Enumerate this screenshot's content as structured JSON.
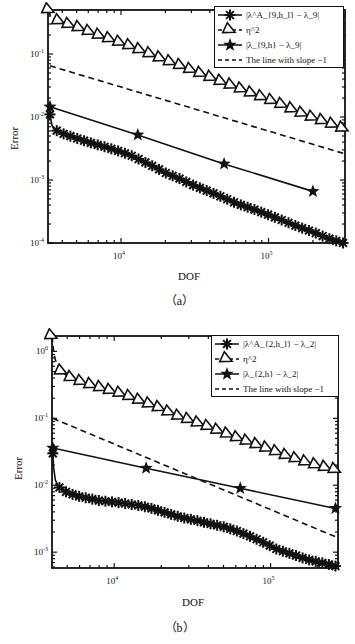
{
  "captions": [
    "（a）",
    "（b）"
  ],
  "chart_data": [
    {
      "type": "line",
      "panel": "(a)",
      "title": "",
      "xlabel": "DOF",
      "ylabel": "Error",
      "xscale": "log",
      "yscale": "log",
      "xlim": [
        3200,
        330000
      ],
      "ylim": [
        0.0001,
        0.5
      ],
      "xticks": [
        {
          "value": 10000,
          "label": "10^4"
        },
        {
          "value": 100000,
          "label": "10^5"
        }
      ],
      "yticks": [
        {
          "value": 0.1,
          "label": "10^-1"
        },
        {
          "value": 0.01,
          "label": "10^-2"
        },
        {
          "value": 0.001,
          "label": "10^-3"
        },
        {
          "value": 0.0001,
          "label": "10^-4"
        }
      ],
      "legend": {
        "position": "upper right",
        "entries": [
          {
            "label": "|λ^A_{9,h_l} − λ_9|",
            "marker": "asterisk",
            "line": "solid"
          },
          {
            "label": "η^2",
            "marker": "triangle-right",
            "line": "dashed"
          },
          {
            "label": "|λ_{9,h} − λ_9|",
            "marker": "star",
            "line": "solid"
          },
          {
            "label": "The line with slope −1",
            "marker": "none",
            "line": "dashed"
          }
        ]
      },
      "grid": false,
      "series": [
        {
          "name": "|λ^A_{9,h_l} − λ_9|",
          "marker": "asterisk",
          "line": "solid",
          "x": [
            3300,
            3400,
            3500,
            3700,
            4000,
            4500,
            5000,
            6000,
            7000,
            8000,
            10000,
            12000,
            14000,
            17000,
            20000,
            25000,
            30000,
            40000,
            50000,
            60000,
            80000,
            100000,
            130000,
            160000,
            200000,
            250000,
            320000
          ],
          "y": [
            0.011,
            0.0075,
            0.0065,
            0.006,
            0.0055,
            0.005,
            0.0046,
            0.004,
            0.0036,
            0.0033,
            0.0028,
            0.0024,
            0.002,
            0.0016,
            0.0013,
            0.00105,
            0.00085,
            0.00065,
            0.00052,
            0.00043,
            0.00034,
            0.00028,
            0.00022,
            0.00018,
            0.00015,
            0.00012,
            0.0001
          ]
        },
        {
          "name": "η^2",
          "marker": "triangle-right",
          "line": "dashed",
          "x": [
            3250,
            3300,
            3400,
            3600,
            4000,
            4500,
            5000,
            6000,
            7000,
            8000,
            10000,
            12000,
            15000,
            20000,
            25000,
            30000,
            40000,
            50000,
            60000,
            80000,
            100000,
            130000,
            160000,
            200000,
            250000,
            320000
          ],
          "y": [
            0.5,
            0.42,
            0.38,
            0.35,
            0.32,
            0.29,
            0.27,
            0.23,
            0.2,
            0.18,
            0.15,
            0.13,
            0.105,
            0.08,
            0.066,
            0.056,
            0.043,
            0.035,
            0.03,
            0.023,
            0.019,
            0.015,
            0.012,
            0.0098,
            0.0082,
            0.0066
          ]
        },
        {
          "name": "|λ_{9,h} − λ_9|",
          "marker": "star",
          "line": "solid",
          "x": [
            3300,
            13000,
            50000,
            200000
          ],
          "y": [
            0.0145,
            0.0052,
            0.0018,
            0.00066
          ]
        },
        {
          "name": "The line with slope −1",
          "marker": "none",
          "line": "dashed",
          "x": [
            3300,
            330000
          ],
          "y": [
            0.065,
            0.0026
          ]
        }
      ]
    },
    {
      "type": "line",
      "panel": "(b)",
      "title": "",
      "xlabel": "DOF",
      "ylabel": "Error",
      "xscale": "log",
      "yscale": "log",
      "xlim": [
        4000,
        270000
      ],
      "ylim": [
        0.00058,
        1.7
      ],
      "xticks": [
        {
          "value": 10000,
          "label": "10^4"
        },
        {
          "value": 100000,
          "label": "10^5"
        }
      ],
      "yticks": [
        {
          "value": 1,
          "label": "10^0"
        },
        {
          "value": 0.1,
          "label": "10^-1"
        },
        {
          "value": 0.01,
          "label": "10^-2"
        },
        {
          "value": 0.001,
          "label": "10^-3"
        }
      ],
      "legend": {
        "position": "upper right",
        "entries": [
          {
            "label": "|λ^A_{2,h_l} − λ_2|",
            "marker": "asterisk",
            "line": "solid"
          },
          {
            "label": "η^2",
            "marker": "triangle-right",
            "line": "dashed"
          },
          {
            "label": "|λ_{2,h} − λ_2|",
            "marker": "star",
            "line": "solid"
          },
          {
            "label": "The line with slope −1",
            "marker": "none",
            "line": "dashed"
          }
        ]
      },
      "grid": false,
      "series": [
        {
          "name": "|λ^A_{2,h_l} − λ_2|",
          "marker": "asterisk",
          "line": "solid",
          "x": [
            4050,
            4100,
            4200,
            4400,
            4700,
            5000,
            5500,
            6000,
            7000,
            8000,
            10000,
            12000,
            15000,
            18000,
            22000,
            27000,
            33000,
            40000,
            50000,
            60000,
            75000,
            90000,
            110000,
            140000,
            170000,
            210000,
            260000
          ],
          "y": [
            0.03,
            0.018,
            0.012,
            0.0095,
            0.0085,
            0.0078,
            0.0072,
            0.0068,
            0.0063,
            0.0059,
            0.0056,
            0.0053,
            0.0049,
            0.0044,
            0.0038,
            0.0033,
            0.003,
            0.0027,
            0.0024,
            0.0021,
            0.0017,
            0.0014,
            0.0011,
            0.00092,
            0.00078,
            0.0007,
            0.00062
          ]
        },
        {
          "name": "η^2",
          "marker": "triangle-right",
          "line": "dashed",
          "x": [
            4000,
            4050,
            4100,
            4200,
            4400,
            4700,
            5000,
            5500,
            6000,
            7000,
            8000,
            10000,
            12000,
            15000,
            20000,
            25000,
            30000,
            40000,
            50000,
            60000,
            80000,
            100000,
            130000,
            170000,
            210000,
            260000
          ],
          "y": [
            1.7,
            1.3,
            1.0,
            0.75,
            0.58,
            0.48,
            0.43,
            0.39,
            0.36,
            0.32,
            0.29,
            0.25,
            0.22,
            0.18,
            0.14,
            0.11,
            0.095,
            0.075,
            0.061,
            0.052,
            0.041,
            0.034,
            0.027,
            0.022,
            0.019,
            0.017
          ]
        },
        {
          "name": "|λ_{2,h} − λ_2|",
          "marker": "star",
          "line": "solid",
          "x": [
            4050,
            16000,
            64000,
            260000
          ],
          "y": [
            0.036,
            0.018,
            0.009,
            0.0045
          ]
        },
        {
          "name": "The line with slope −1",
          "marker": "none",
          "line": "dashed",
          "x": [
            4050,
            260000
          ],
          "y": [
            0.1,
            0.0017
          ]
        }
      ]
    }
  ]
}
